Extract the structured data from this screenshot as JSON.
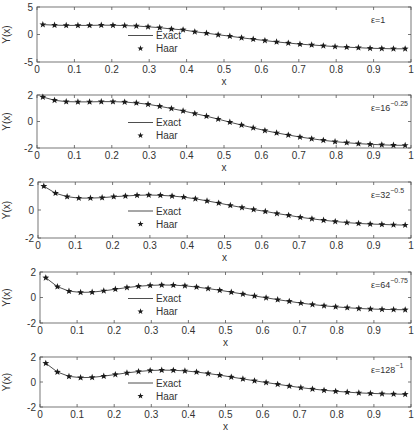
{
  "figure": {
    "width": 420,
    "height": 435,
    "line_color": "#3a3a3a",
    "marker_color": "#1a1a1a",
    "axis_color": "#555555",
    "text_color": "#333333"
  },
  "chart_data": [
    {
      "type": "line",
      "title": "",
      "annotation": {
        "base": "ε=1",
        "exponent": ""
      },
      "xlabel": "x",
      "ylabel": "Y(x)",
      "xlim": [
        0,
        1
      ],
      "ylim": [
        -5,
        5
      ],
      "xticks": [
        "0",
        "0.1",
        "0.2",
        "0.3",
        "0.4",
        "0.5",
        "0.6",
        "0.7",
        "0.8",
        "0.9",
        "1"
      ],
      "yticks": [
        "5",
        "0",
        "-5"
      ],
      "yticks_values": [
        5,
        0,
        -5
      ],
      "legend": [
        "Exact",
        "Haar"
      ],
      "legend_position": "center-left",
      "grid": false,
      "frame": {
        "left": 37,
        "top": 7,
        "right": 411,
        "bottom": 62
      },
      "x": [
        0.0156,
        0.0469,
        0.0781,
        0.1094,
        0.1406,
        0.1719,
        0.2031,
        0.2344,
        0.2656,
        0.2969,
        0.3281,
        0.3594,
        0.3906,
        0.4219,
        0.4531,
        0.4844,
        0.5156,
        0.5469,
        0.5781,
        0.6094,
        0.6406,
        0.6719,
        0.7031,
        0.7344,
        0.7656,
        0.7969,
        0.8281,
        0.8594,
        0.8906,
        0.9219,
        0.9531,
        0.9844
      ],
      "series": [
        {
          "name": "Exact",
          "style": "line",
          "values": [
            1.8,
            1.7,
            1.65,
            1.65,
            1.65,
            1.7,
            1.68,
            1.62,
            1.55,
            1.4,
            1.25,
            1.0,
            0.85,
            0.5,
            0.25,
            -0.05,
            -0.3,
            -0.6,
            -0.85,
            -1.1,
            -1.35,
            -1.55,
            -1.75,
            -1.9,
            -2.05,
            -2.2,
            -2.3,
            -2.4,
            -2.5,
            -2.55,
            -2.6,
            -2.6
          ]
        },
        {
          "name": "Haar",
          "style": "star",
          "values": [
            1.8,
            1.7,
            1.65,
            1.65,
            1.65,
            1.7,
            1.68,
            1.62,
            1.55,
            1.4,
            1.25,
            1.0,
            0.85,
            0.5,
            0.25,
            -0.05,
            -0.3,
            -0.6,
            -0.85,
            -1.1,
            -1.35,
            -1.55,
            -1.75,
            -1.9,
            -2.05,
            -2.2,
            -2.3,
            -2.4,
            -2.5,
            -2.55,
            -2.6,
            -2.6
          ]
        }
      ]
    },
    {
      "type": "line",
      "title": "",
      "annotation": {
        "base": "ε=16",
        "exponent": "−0.25"
      },
      "xlabel": "x",
      "ylabel": "Y(x)",
      "xlim": [
        0,
        1
      ],
      "ylim": [
        -2,
        2
      ],
      "xticks": [
        "0",
        "0.1",
        "0.2",
        "0.3",
        "0.4",
        "0.5",
        "0.6",
        "0.7",
        "0.8",
        "0.9",
        "1"
      ],
      "yticks": [
        "2",
        "0",
        "-2"
      ],
      "yticks_values": [
        2,
        0,
        -2
      ],
      "legend": [
        "Exact",
        "Haar"
      ],
      "legend_position": "center-left",
      "grid": false,
      "frame": {
        "left": 37,
        "top": 95,
        "right": 411,
        "bottom": 148
      },
      "x": [
        0.0156,
        0.0469,
        0.0781,
        0.1094,
        0.1406,
        0.1719,
        0.2031,
        0.2344,
        0.2656,
        0.2969,
        0.3281,
        0.3594,
        0.3906,
        0.4219,
        0.4531,
        0.4844,
        0.5156,
        0.5469,
        0.5781,
        0.6094,
        0.6406,
        0.6719,
        0.7031,
        0.7344,
        0.7656,
        0.7969,
        0.8281,
        0.8594,
        0.8906,
        0.9219,
        0.9531,
        0.9844
      ],
      "series": [
        {
          "name": "Exact",
          "style": "line",
          "values": [
            1.85,
            1.6,
            1.5,
            1.48,
            1.48,
            1.5,
            1.5,
            1.47,
            1.4,
            1.3,
            1.15,
            0.98,
            0.8,
            0.6,
            0.4,
            0.18,
            -0.05,
            -0.27,
            -0.48,
            -0.68,
            -0.86,
            -1.02,
            -1.17,
            -1.3,
            -1.42,
            -1.52,
            -1.6,
            -1.67,
            -1.72,
            -1.76,
            -1.79,
            -1.8
          ]
        },
        {
          "name": "Haar",
          "style": "star",
          "values": [
            1.85,
            1.6,
            1.5,
            1.48,
            1.48,
            1.5,
            1.5,
            1.47,
            1.4,
            1.3,
            1.15,
            0.98,
            0.8,
            0.6,
            0.4,
            0.18,
            -0.05,
            -0.27,
            -0.48,
            -0.68,
            -0.86,
            -1.02,
            -1.17,
            -1.3,
            -1.42,
            -1.52,
            -1.6,
            -1.67,
            -1.72,
            -1.76,
            -1.79,
            -1.8
          ]
        }
      ]
    },
    {
      "type": "line",
      "title": "",
      "annotation": {
        "base": "ε=32",
        "exponent": "−0.5"
      },
      "xlabel": "x",
      "ylabel": "Y(x)",
      "xlim": [
        0,
        1
      ],
      "ylim": [
        -2,
        2
      ],
      "xticks": [
        "0",
        "0.1",
        "0.2",
        "0.3",
        "0.4",
        "0.5",
        "0.6",
        "0.7",
        "0.8",
        "0.9",
        "1"
      ],
      "yticks": [
        "2",
        "0",
        "-2"
      ],
      "yticks_values": [
        2,
        0,
        -2
      ],
      "legend": [
        "Exact",
        "Haar"
      ],
      "legend_position": "center-left",
      "grid": false,
      "frame": {
        "left": 38,
        "top": 182,
        "right": 411,
        "bottom": 238
      },
      "x": [
        0.0156,
        0.0469,
        0.0781,
        0.1094,
        0.1406,
        0.1719,
        0.2031,
        0.2344,
        0.2656,
        0.2969,
        0.3281,
        0.3594,
        0.3906,
        0.4219,
        0.4531,
        0.4844,
        0.5156,
        0.5469,
        0.5781,
        0.6094,
        0.6406,
        0.6719,
        0.7031,
        0.7344,
        0.7656,
        0.7969,
        0.8281,
        0.8594,
        0.8906,
        0.9219,
        0.9531,
        0.9844
      ],
      "series": [
        {
          "name": "Exact",
          "style": "line",
          "values": [
            1.7,
            1.2,
            0.95,
            0.85,
            0.85,
            0.88,
            0.95,
            1.0,
            1.05,
            1.07,
            1.05,
            1.0,
            0.92,
            0.8,
            0.65,
            0.5,
            0.33,
            0.18,
            0.03,
            -0.1,
            -0.25,
            -0.38,
            -0.52,
            -0.63,
            -0.73,
            -0.82,
            -0.9,
            -0.96,
            -1.0,
            -1.03,
            -1.06,
            -1.08
          ]
        },
        {
          "name": "Haar",
          "style": "star",
          "values": [
            1.7,
            1.2,
            0.95,
            0.85,
            0.85,
            0.88,
            0.95,
            1.0,
            1.05,
            1.07,
            1.05,
            1.0,
            0.92,
            0.8,
            0.65,
            0.5,
            0.33,
            0.18,
            0.03,
            -0.1,
            -0.25,
            -0.38,
            -0.52,
            -0.63,
            -0.73,
            -0.82,
            -0.9,
            -0.96,
            -1.0,
            -1.03,
            -1.06,
            -1.08
          ]
        }
      ]
    },
    {
      "type": "line",
      "title": "",
      "annotation": {
        "base": "ε=64",
        "exponent": "−0.75"
      },
      "xlabel": "x",
      "ylabel": "Y(x)",
      "xlim": [
        0,
        1
      ],
      "ylim": [
        -2,
        2
      ],
      "xticks": [
        "0",
        "0.1",
        "0.2",
        "0.3",
        "0.4",
        "0.5",
        "0.6",
        "0.7",
        "0.8",
        "0.9",
        "1"
      ],
      "yticks": [
        "2",
        "0",
        "-2"
      ],
      "yticks_values": [
        2,
        0,
        -2
      ],
      "legend": [
        "Exact",
        "Haar"
      ],
      "legend_position": "center-left",
      "grid": false,
      "frame": {
        "left": 40,
        "top": 272,
        "right": 411,
        "bottom": 323
      },
      "x": [
        0.0156,
        0.0469,
        0.0781,
        0.1094,
        0.1406,
        0.1719,
        0.2031,
        0.2344,
        0.2656,
        0.2969,
        0.3281,
        0.3594,
        0.3906,
        0.4219,
        0.4531,
        0.4844,
        0.5156,
        0.5469,
        0.5781,
        0.6094,
        0.6406,
        0.6719,
        0.7031,
        0.7344,
        0.7656,
        0.7969,
        0.8281,
        0.8594,
        0.8906,
        0.9219,
        0.9531,
        0.9844
      ],
      "series": [
        {
          "name": "Exact",
          "style": "line",
          "values": [
            1.55,
            0.85,
            0.5,
            0.4,
            0.42,
            0.52,
            0.65,
            0.78,
            0.88,
            0.95,
            0.98,
            0.97,
            0.92,
            0.82,
            0.7,
            0.57,
            0.42,
            0.27,
            0.12,
            -0.02,
            -0.17,
            -0.3,
            -0.44,
            -0.55,
            -0.65,
            -0.73,
            -0.8,
            -0.86,
            -0.9,
            -0.93,
            -0.95,
            -0.96
          ]
        },
        {
          "name": "Haar",
          "style": "star",
          "values": [
            1.55,
            0.85,
            0.5,
            0.4,
            0.42,
            0.52,
            0.65,
            0.78,
            0.88,
            0.95,
            0.98,
            0.97,
            0.92,
            0.82,
            0.7,
            0.57,
            0.42,
            0.27,
            0.12,
            -0.02,
            -0.17,
            -0.3,
            -0.44,
            -0.55,
            -0.65,
            -0.73,
            -0.8,
            -0.86,
            -0.9,
            -0.93,
            -0.95,
            -0.96
          ]
        }
      ]
    },
    {
      "type": "line",
      "title": "",
      "annotation": {
        "base": "ε=128",
        "exponent": "−1"
      },
      "xlabel": "x",
      "ylabel": "Y(x)",
      "xlim": [
        0,
        1
      ],
      "ylim": [
        -2,
        2
      ],
      "xticks": [
        "0",
        "0.1",
        "0.2",
        "0.3",
        "0.4",
        "0.5",
        "0.6",
        "0.7",
        "0.8",
        "0.9",
        "1"
      ],
      "yticks": [
        "2",
        "0",
        "-2"
      ],
      "yticks_values": [
        2,
        0,
        -2
      ],
      "legend": [
        "Exact",
        "Haar"
      ],
      "legend_position": "center-left",
      "grid": false,
      "frame": {
        "left": 40,
        "top": 357,
        "right": 411,
        "bottom": 407
      },
      "x": [
        0.0156,
        0.0469,
        0.0781,
        0.1094,
        0.1406,
        0.1719,
        0.2031,
        0.2344,
        0.2656,
        0.2969,
        0.3281,
        0.3594,
        0.3906,
        0.4219,
        0.4531,
        0.4844,
        0.5156,
        0.5469,
        0.5781,
        0.6094,
        0.6406,
        0.6719,
        0.7031,
        0.7344,
        0.7656,
        0.7969,
        0.8281,
        0.8594,
        0.8906,
        0.9219,
        0.9531,
        0.9844
      ],
      "series": [
        {
          "name": "Exact",
          "style": "line",
          "values": [
            1.5,
            0.8,
            0.45,
            0.35,
            0.37,
            0.47,
            0.6,
            0.73,
            0.84,
            0.92,
            0.95,
            0.94,
            0.89,
            0.8,
            0.68,
            0.55,
            0.4,
            0.25,
            0.1,
            -0.04,
            -0.18,
            -0.32,
            -0.45,
            -0.56,
            -0.66,
            -0.74,
            -0.81,
            -0.87,
            -0.91,
            -0.94,
            -0.96,
            -0.98
          ]
        },
        {
          "name": "Haar",
          "style": "star",
          "values": [
            1.5,
            0.8,
            0.45,
            0.35,
            0.37,
            0.47,
            0.6,
            0.73,
            0.84,
            0.92,
            0.95,
            0.94,
            0.89,
            0.8,
            0.68,
            0.55,
            0.4,
            0.25,
            0.1,
            -0.04,
            -0.18,
            -0.32,
            -0.45,
            -0.56,
            -0.66,
            -0.74,
            -0.81,
            -0.87,
            -0.91,
            -0.94,
            -0.96,
            -0.98
          ]
        }
      ]
    }
  ]
}
